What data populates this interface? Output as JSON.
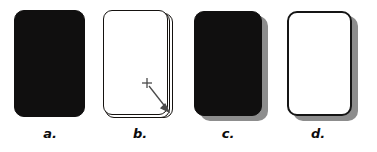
{
  "figure": {
    "background_color": "#ffffff",
    "width": 377,
    "height": 152,
    "caption_style": "bold-italic"
  },
  "colors": {
    "card_black": "#100f0f",
    "card_white": "#ffffff",
    "card_outline": "#151515",
    "drop_shadow": "#8d8d8d",
    "pointer": "#4a4a4a"
  },
  "panels": [
    {
      "id": "a",
      "label": "a.",
      "card_fill": "black",
      "card_outline": false,
      "drop_shadow": false,
      "stacked": false,
      "pointer": false
    },
    {
      "id": "b",
      "label": "b.",
      "card_fill": "white",
      "card_outline": true,
      "drop_shadow": false,
      "stacked": true,
      "stack_count": 3,
      "pointer": true,
      "pointer_glyph": "+",
      "pointer_x": 147,
      "pointer_y": 83,
      "arrow_target_x": 168,
      "arrow_target_y": 111
    },
    {
      "id": "c",
      "label": "c.",
      "card_fill": "black",
      "card_outline": false,
      "drop_shadow": true,
      "stacked": false,
      "pointer": false
    },
    {
      "id": "d",
      "label": "d.",
      "card_fill": "white",
      "card_outline": true,
      "drop_shadow": true,
      "stacked": false,
      "pointer": false
    }
  ]
}
